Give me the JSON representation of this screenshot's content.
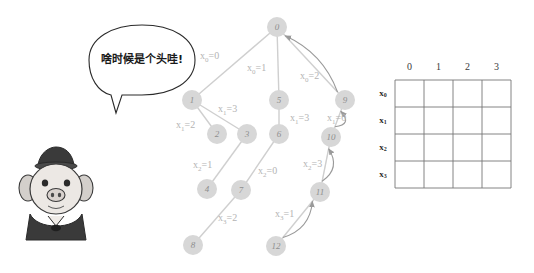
{
  "figure": {
    "background": "#ffffff"
  },
  "character": {
    "name": "cartoon-pig",
    "speech_bubble": {
      "text": "啥时候是个头哇!",
      "shape": "ellipse-with-tail"
    }
  },
  "tree": {
    "node_fill": "#d7d7d7",
    "node_text_color": "#8e8e8e",
    "edge_color": "#cfcfcf",
    "label_color": "#b4b4b4",
    "nodes": [
      {
        "id": "0",
        "label": "0",
        "x": 277,
        "y": 27,
        "r": 10
      },
      {
        "id": "1",
        "label": "1",
        "x": 192,
        "y": 100,
        "r": 10
      },
      {
        "id": "2",
        "label": "2",
        "x": 217,
        "y": 134,
        "r": 10
      },
      {
        "id": "3",
        "label": "3",
        "x": 247,
        "y": 134,
        "r": 10
      },
      {
        "id": "4",
        "label": "4",
        "x": 207,
        "y": 189,
        "r": 10
      },
      {
        "id": "5",
        "label": "5",
        "x": 279,
        "y": 100,
        "r": 10
      },
      {
        "id": "6",
        "label": "6",
        "x": 279,
        "y": 134,
        "r": 10
      },
      {
        "id": "7",
        "label": "7",
        "x": 241,
        "y": 190,
        "r": 10
      },
      {
        "id": "8",
        "label": "8",
        "x": 193,
        "y": 245,
        "r": 10
      },
      {
        "id": "9",
        "label": "9",
        "x": 345,
        "y": 100,
        "r": 10
      },
      {
        "id": "10",
        "label": "10",
        "x": 331,
        "y": 137,
        "r": 10
      },
      {
        "id": "11",
        "label": "11",
        "x": 320,
        "y": 192,
        "r": 10
      },
      {
        "id": "12",
        "label": "12",
        "x": 276,
        "y": 246,
        "r": 10
      }
    ],
    "edges": [
      {
        "from": "0",
        "to": "1"
      },
      {
        "from": "0",
        "to": "5"
      },
      {
        "from": "0",
        "to": "9"
      },
      {
        "from": "1",
        "to": "2"
      },
      {
        "from": "1",
        "to": "3"
      },
      {
        "from": "3",
        "to": "4"
      },
      {
        "from": "5",
        "to": "6"
      },
      {
        "from": "6",
        "to": "7"
      },
      {
        "from": "7",
        "to": "8"
      },
      {
        "from": "9",
        "to": "10"
      },
      {
        "from": "10",
        "to": "11"
      },
      {
        "from": "11",
        "to": "12"
      }
    ],
    "edge_labels": [
      {
        "var": "x",
        "sub": "0",
        "value": "0",
        "x": 200,
        "y": 57
      },
      {
        "var": "x",
        "sub": "0",
        "value": "1",
        "x": 247,
        "y": 69
      },
      {
        "var": "x",
        "sub": "0",
        "value": "2",
        "x": 300,
        "y": 77
      },
      {
        "var": "x",
        "sub": "1",
        "value": "2",
        "x": 176,
        "y": 126
      },
      {
        "var": "x",
        "sub": "1",
        "value": "3",
        "x": 218,
        "y": 110
      },
      {
        "var": "x",
        "sub": "1",
        "value": "3",
        "x": 290,
        "y": 119
      },
      {
        "var": "x",
        "sub": "1",
        "value": "0",
        "x": 327,
        "y": 119
      },
      {
        "var": "x",
        "sub": "2",
        "value": "1",
        "x": 193,
        "y": 166
      },
      {
        "var": "x",
        "sub": "2",
        "value": "0",
        "x": 258,
        "y": 172
      },
      {
        "var": "x",
        "sub": "2",
        "value": "3",
        "x": 303,
        "y": 165
      },
      {
        "var": "x",
        "sub": "3",
        "value": "2",
        "x": 218,
        "y": 219
      },
      {
        "var": "x",
        "sub": "3",
        "value": "1",
        "x": 275,
        "y": 215
      }
    ],
    "backtrack_arrows": [
      {
        "from": "9",
        "to": "0",
        "name": "backtrack-9-to-0"
      },
      {
        "from": "10",
        "to": "9",
        "name": "backtrack-10-to-9"
      },
      {
        "from": "11",
        "to": "10",
        "name": "backtrack-11-to-10"
      },
      {
        "from": "12",
        "to": "11",
        "name": "backtrack-12-to-11"
      }
    ]
  },
  "grid": {
    "name": "assignment-table",
    "column_headers": [
      "0",
      "1",
      "2",
      "3"
    ],
    "row_headers": [
      {
        "var": "x",
        "sub": "0"
      },
      {
        "var": "x",
        "sub": "1"
      },
      {
        "var": "x",
        "sub": "2"
      },
      {
        "var": "x",
        "sub": "3"
      }
    ],
    "cells": [
      [
        "",
        "",
        "",
        ""
      ],
      [
        "",
        "",
        "",
        ""
      ],
      [
        "",
        "",
        "",
        ""
      ],
      [
        "",
        "",
        "",
        ""
      ]
    ],
    "left": 395,
    "top": 80,
    "cell_width": 29,
    "cell_height": 27,
    "border_color": "#777777"
  }
}
